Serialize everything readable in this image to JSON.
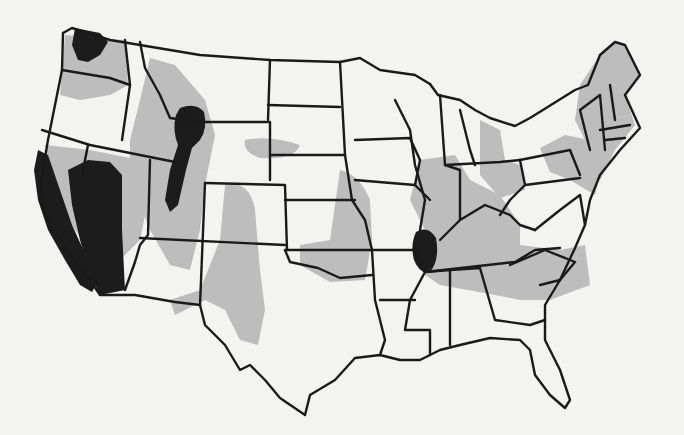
{
  "map": {
    "subject": "Contiguous United States with state boundaries",
    "colors": {
      "background": "#f3f3f2",
      "moderate_zone": "#bdbdbd",
      "high_zone": "#1c1c1c",
      "border": "#1a1a1a"
    },
    "legend_categories": [
      "none",
      "moderate",
      "high"
    ],
    "high_zones": [
      "northwest-washington",
      "california-coast",
      "western-nevada",
      "idaho-montana-wyoming-junction",
      "utah-wasatch",
      "new-madrid-missouri-tennessee"
    ],
    "moderate_zones": [
      "pacific-northwest",
      "intermountain-west",
      "rio-grande-arizona-new-mexico",
      "central-plains-oklahoma-kansas",
      "mississippi-ohio-valleys",
      "southeast-south-carolina",
      "northeast-new-england",
      "wyoming-nebraska"
    ],
    "visible_text": []
  }
}
